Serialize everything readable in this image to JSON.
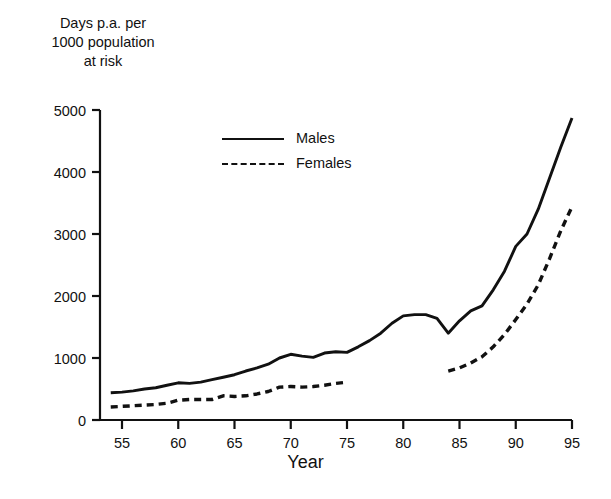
{
  "chart_data": {
    "type": "line",
    "title": "",
    "ylabel": "Days p.a. per\n1000 population\nat risk",
    "xlabel": "Year",
    "xlim": [
      53.5,
      95.5
    ],
    "ylim": [
      0,
      5000
    ],
    "xticks": [
      "55",
      "60",
      "65",
      "70",
      "75",
      "80",
      "85",
      "90",
      "95"
    ],
    "xtick_values": [
      55,
      60,
      65,
      70,
      75,
      80,
      85,
      90,
      95
    ],
    "yticks": [
      "0",
      "1000",
      "2000",
      "3000",
      "4000",
      "5000"
    ],
    "ytick_values": [
      0,
      1000,
      2000,
      3000,
      4000,
      5000
    ],
    "grid": false,
    "legend_position": "upper-left-inside",
    "series": [
      {
        "name": "Males",
        "style": "solid",
        "color": "#111111",
        "x": [
          54,
          55,
          56,
          57,
          58,
          59,
          60,
          61,
          62,
          63,
          64,
          65,
          66,
          67,
          68,
          69,
          70,
          71,
          72,
          73,
          74,
          75,
          76,
          77,
          78,
          79,
          80,
          81,
          82,
          83,
          84,
          85,
          86,
          87,
          88,
          89,
          90,
          91,
          92,
          93,
          94,
          95
        ],
        "y": [
          440,
          450,
          470,
          500,
          520,
          560,
          600,
          590,
          610,
          650,
          690,
          730,
          790,
          840,
          900,
          1000,
          1060,
          1030,
          1010,
          1080,
          1100,
          1090,
          1180,
          1280,
          1400,
          1560,
          1680,
          1700,
          1700,
          1640,
          1400,
          1600,
          1760,
          1840,
          2100,
          2400,
          2800,
          3000,
          3400,
          3900,
          4400,
          4870
        ]
      },
      {
        "name": "Females",
        "style": "dashed",
        "color": "#111111",
        "segments": [
          {
            "x": [
              54,
              55,
              56,
              57,
              58,
              59,
              60,
              61,
              62,
              63,
              64,
              65,
              66,
              67,
              68,
              69,
              70,
              71,
              72,
              73,
              74,
              75
            ],
            "y": [
              210,
              220,
              230,
              240,
              250,
              270,
              320,
              330,
              330,
              330,
              390,
              380,
              390,
              420,
              460,
              530,
              540,
              530,
              540,
              560,
              590,
              610
            ]
          },
          {
            "x": [
              84,
              85,
              86,
              87,
              88,
              89,
              90,
              91,
              92,
              93,
              94,
              95
            ],
            "y": [
              790,
              840,
              920,
              1020,
              1180,
              1380,
              1620,
              1870,
              2180,
              2600,
              3050,
              3440
            ]
          }
        ]
      }
    ]
  },
  "legend": {
    "items": [
      {
        "label": "Males",
        "style": "solid"
      },
      {
        "label": "Females",
        "style": "dashed"
      }
    ]
  }
}
